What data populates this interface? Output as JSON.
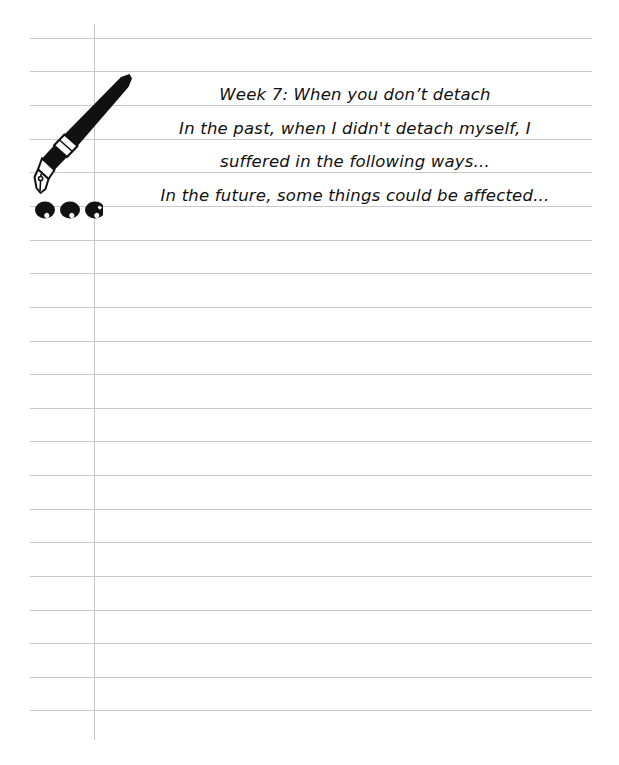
{
  "document": {
    "type": "lined-notebook-page",
    "page_width": 619,
    "page_height": 765,
    "background_color": "#ffffff",
    "rule_line_color": "#c9c9cc",
    "margin_line_color": "#c6c6ca",
    "ink_color": "#111111",
    "rule_line_left": 30,
    "rule_line_right": 592,
    "rule_line_spacing": 33.6,
    "rule_line_first_y": 38,
    "rule_line_count": 21,
    "margin_line_x": 94,
    "margin_line_top": 24,
    "margin_line_bottom": 740
  },
  "illustration": {
    "pen": {
      "name": "fountain-pen",
      "description": "black fountain pen tilted diagonally, nib pointing down-left, white grip band with two thin rings",
      "body_color": "#111111",
      "grip_color": "#ffffff",
      "tip_x": 130,
      "tip_y": 75,
      "nib_x": 48,
      "nib_y": 192
    },
    "ink_dots": {
      "name": "ink-blots",
      "count": 3,
      "color": "#111111",
      "y": 210,
      "x_positions": [
        45,
        70,
        95
      ]
    }
  },
  "note": {
    "lines": [
      "Week 7: When you don’t detach",
      "In the past, when I didn't detach myself, I",
      "suffered in the following ways...",
      "In the future, some things could be affected..."
    ],
    "title": "Week 7: When you don’t detach",
    "alignment": "center",
    "font_style": "handwriting-italic"
  }
}
